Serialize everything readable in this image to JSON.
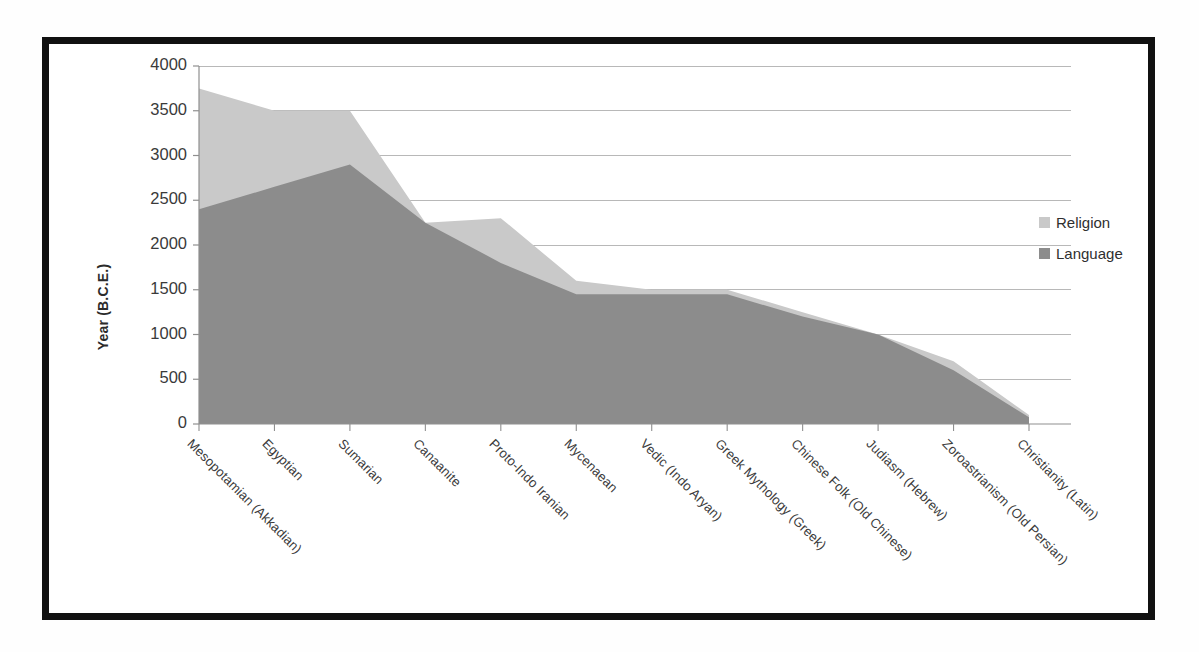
{
  "chart_data": {
    "type": "area",
    "title": "",
    "subtitle": "",
    "xlabel": "",
    "ylabel": "Year (B.C.E.)",
    "ylim": [
      0,
      4000
    ],
    "ytick_step": 500,
    "grid": true,
    "stacked": false,
    "legend_position": "right",
    "categories": [
      "Mesopotamian (Akkadian)",
      "Egyptian",
      "Sumarian",
      "Canaanite",
      "Proto-Indo Iranian",
      "Mycenaean",
      "Vedic (Indo Aryan)",
      "Greek Mythology (Greek)",
      "Chinese Folk (Old Chinese)",
      "Judiasm (Hebrew)",
      "Zoroastrianism (Old Persian)",
      "Christianity (Latin)"
    ],
    "ytick_labels": [
      "0",
      "500",
      "1000",
      "1500",
      "2000",
      "2500",
      "3000",
      "3500",
      "4000"
    ],
    "series": [
      {
        "name": "Religion",
        "color": "#c9c9c9",
        "values": [
          3750,
          3500,
          3500,
          2250,
          2300,
          1600,
          1500,
          1500,
          1250,
          1000,
          700,
          100
        ]
      },
      {
        "name": "Language",
        "color": "#8c8c8c",
        "values": [
          2400,
          2650,
          2900,
          2250,
          1800,
          1450,
          1450,
          1450,
          1200,
          1000,
          600,
          75
        ]
      }
    ]
  },
  "legend": {
    "items": [
      {
        "label": "Religion",
        "color": "#c9c9c9"
      },
      {
        "label": "Language",
        "color": "#8c8c8c"
      }
    ]
  },
  "axes": {
    "y_title": "Year (B.C.E.)"
  },
  "colors": {
    "frame": "#111111",
    "gridline": "#b8b8b8",
    "axis": "#8f8f8f",
    "religion": "#c9c9c9",
    "language": "#8c8c8c",
    "text": "#3a3a3a"
  }
}
